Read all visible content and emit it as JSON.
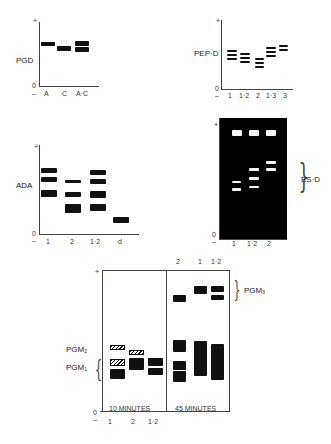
{
  "panels": {
    "pgd": {
      "label": "PGD",
      "axis_top": "+",
      "axis_zero": "0",
      "axis_minus": "–",
      "lanes": [
        "A",
        "C",
        "A·C"
      ]
    },
    "pepd": {
      "label": "PEP·D",
      "axis_top": "+",
      "axis_zero": "0",
      "axis_minus": "–",
      "lanes": [
        "1",
        "1·2",
        "2",
        "1·3",
        "3"
      ]
    },
    "ada": {
      "label": "ADA",
      "axis_top": "+",
      "axis_zero": "0",
      "axis_minus": "–",
      "lanes": [
        "1",
        "2",
        "1·2",
        "d"
      ]
    },
    "esd": {
      "label": "ES·D",
      "axis_top": "+",
      "axis_zero": "0",
      "axis_minus": "–",
      "lanes": [
        "1",
        "1·2",
        "2"
      ]
    },
    "pgm": {
      "label_pgm2": "PGM",
      "label_pgm2_sub": "2",
      "label_pgm1": "PGM",
      "label_pgm1_sub": "1",
      "label_pgm3": "PGM",
      "label_pgm3_sub": "3",
      "axis_top": "+",
      "axis_zero": "0",
      "axis_minus": "–",
      "section_10": "10 MINUTES",
      "section_45": "45 MINUTES",
      "lanes_10": [
        "1",
        "2",
        "1·2"
      ],
      "lanes_45": [
        "2",
        "1",
        "1·2"
      ]
    }
  }
}
